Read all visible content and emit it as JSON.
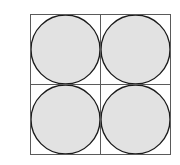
{
  "figure": {
    "label": "2)",
    "canvas": {
      "width": 180,
      "height": 165,
      "background": "#ffffff"
    },
    "colors": {
      "background": "#ffffff",
      "square_stroke": "#5a5a5a",
      "divider_stroke": "#5a5a5a",
      "circle_stroke": "#1a1a1a",
      "circle_fill": "#e2e2e2",
      "label_text": "#2b2b2b"
    },
    "square": {
      "name": "outer-square",
      "x": 30.5,
      "y": 14.5,
      "width": 140,
      "height": 140,
      "stroke_width": 1,
      "fill": "none"
    },
    "dividers": [
      {
        "name": "vertical-divider",
        "orientation": "vertical",
        "x1": 100.5,
        "y1": 14.5,
        "x2": 100.5,
        "y2": 154.5,
        "stroke_width": 1
      },
      {
        "name": "horizontal-divider",
        "orientation": "horizontal",
        "x1": 30.5,
        "y1": 84.5,
        "x2": 170.5,
        "y2": 84.5,
        "stroke_width": 1
      }
    ],
    "circles": [
      {
        "name": "circle-top-left",
        "quadrant": "top-left",
        "cx": 65.5,
        "cy": 49.5,
        "r": 34.5,
        "stroke_width": 1.3
      },
      {
        "name": "circle-top-right",
        "quadrant": "top-right",
        "cx": 135.5,
        "cy": 49.5,
        "r": 34.5,
        "stroke_width": 1.3
      },
      {
        "name": "circle-bottom-left",
        "quadrant": "bottom-left",
        "cx": 65.5,
        "cy": 119.5,
        "r": 34.5,
        "stroke_width": 1.3
      },
      {
        "name": "circle-bottom-right",
        "quadrant": "bottom-right",
        "cx": 135.5,
        "cy": 119.5,
        "r": 34.5,
        "stroke_width": 1.3
      }
    ],
    "counts": {
      "circle_count": 4,
      "cell_count": 4
    }
  }
}
